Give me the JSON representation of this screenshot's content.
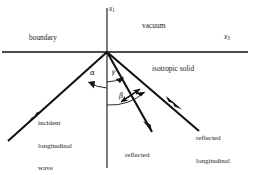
{
  "figure": {
    "type": "physics-diagram"
  },
  "axes": {
    "vertical": {
      "symbol": "x",
      "subscript": "1",
      "name": "x1-axis"
    },
    "horizontal": {
      "symbol": "x",
      "subscript": "3",
      "name": "x3-axis"
    }
  },
  "regions": {
    "upper": "vacuum",
    "lower": "isotropic solid",
    "interface": "boundary"
  },
  "angles": [
    {
      "symbol": "α",
      "name": "alpha",
      "ray": "incident-longitudinal"
    },
    {
      "symbol": "γ",
      "name": "gamma",
      "ray": "reflected-transverse"
    },
    {
      "symbol": "β",
      "name": "beta",
      "ray": "reflected-longitudinal"
    }
  ],
  "rays": [
    {
      "name": "incident-longitudinal-wave",
      "label_lines": [
        "incident",
        "longitudinal",
        "wave"
      ],
      "polarization": "longitudinal",
      "direction": "toward-origin"
    },
    {
      "name": "reflected-transverse-wave",
      "label_lines": [
        "reflected",
        "transverse",
        "wave"
      ],
      "polarization": "transverse",
      "direction": "away-from-origin"
    },
    {
      "name": "reflected-longitudinal-wave",
      "label_lines": [
        "reflected",
        "longitudinal",
        "wave"
      ],
      "polarization": "longitudinal",
      "direction": "away-from-origin"
    }
  ],
  "colors": {
    "ink": "#111111",
    "background": "#ffffff"
  }
}
